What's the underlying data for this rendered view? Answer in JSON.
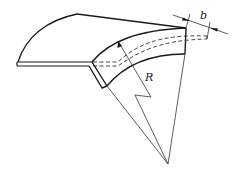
{
  "diagram": {
    "labels": {
      "radius": "R",
      "width": "b"
    },
    "colors": {
      "line": "#1a1a1a",
      "thin_line": "#333333",
      "background": "#ffffff"
    }
  }
}
